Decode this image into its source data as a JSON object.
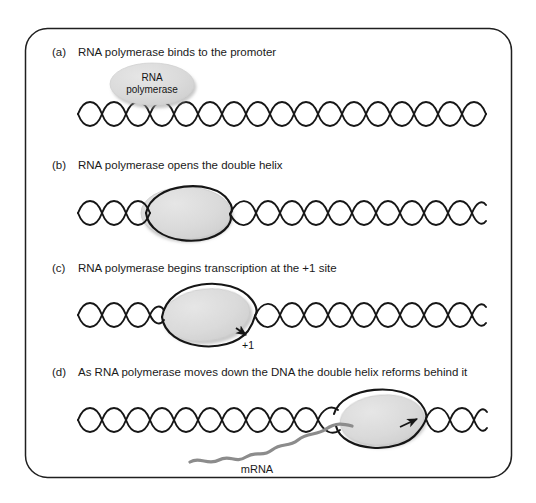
{
  "figure": {
    "title_present": false,
    "border_color": "#1f1f1f",
    "background_color": "#ffffff"
  },
  "style": {
    "enzyme_fill": "#d9d9d9",
    "enzyme_stroke": "#141414",
    "dna_stroke": "#161616",
    "mrna_stroke": "#8c8c8c",
    "text_color": "#1a1a1a"
  },
  "panels": [
    {
      "letter": "(a)",
      "caption": "RNA polymerase binds to the promoter",
      "enzyme_label_line1": "RNA",
      "enzyme_label_line2": "polymerase"
    },
    {
      "letter": "(b)",
      "caption": "RNA polymerase opens the double helix"
    },
    {
      "letter": "(c)",
      "caption": "RNA polymerase begins transcription at the +1 site",
      "site_label": "+1"
    },
    {
      "letter": "(d)",
      "caption": "As RNA polymerase moves down the DNA the double helix reforms behind it",
      "mrna_label": "mRNA"
    }
  ]
}
